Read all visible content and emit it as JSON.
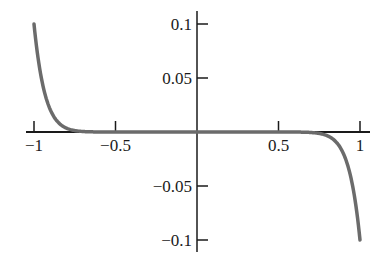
{
  "chart_data": {
    "type": "line",
    "title": "",
    "xlabel": "",
    "ylabel": "",
    "xlim": [
      -1,
      1
    ],
    "ylim": [
      -0.1,
      0.1
    ],
    "grid": false,
    "legend": null,
    "x_ticks": [
      -1,
      -0.5,
      0.5,
      1
    ],
    "x_tick_labels": [
      "−1",
      "−0.5",
      "0.5",
      "1"
    ],
    "y_ticks": [
      0.1,
      0.05,
      -0.05,
      -0.1
    ],
    "y_tick_labels": [
      "0.1",
      "0.05",
      "−0.05",
      "−0.1"
    ],
    "series": [
      {
        "name": "curve",
        "description": "odd function, approximately y = -0.1 x^15",
        "x": [
          -1,
          -0.98,
          -0.96,
          -0.94,
          -0.92,
          -0.9,
          -0.85,
          -0.8,
          -0.75,
          -0.7,
          -0.6,
          -0.5,
          0,
          0.5,
          0.6,
          0.7,
          0.75,
          0.8,
          0.85,
          0.9,
          0.92,
          0.94,
          0.96,
          0.98,
          1
        ],
        "y": [
          0.1,
          0.074,
          0.054,
          0.039,
          0.029,
          0.021,
          0.0087,
          0.0035,
          0.0013,
          0.0005,
          0.0,
          0.0,
          0.0,
          0.0,
          0.0,
          -0.0005,
          -0.0013,
          -0.0035,
          -0.0087,
          -0.021,
          -0.029,
          -0.039,
          -0.054,
          -0.074,
          -0.1
        ],
        "color": "#6b6b6b"
      }
    ],
    "axis_color": "#1a1a1a"
  }
}
